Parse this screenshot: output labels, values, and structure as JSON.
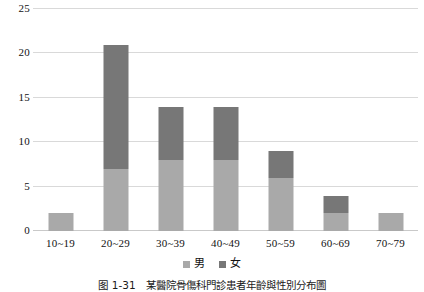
{
  "chart_data": {
    "type": "bar",
    "stacked": true,
    "title": "",
    "subtitle": "",
    "xlabel": "",
    "ylabel": "",
    "categories": [
      "10~19",
      "20~29",
      "30~39",
      "40~49",
      "50~59",
      "60~69",
      "70~79"
    ],
    "series": [
      {
        "name": "男",
        "values": [
          2,
          7,
          8,
          8,
          6,
          2,
          2
        ],
        "color": "#a9a9a9"
      },
      {
        "name": "女",
        "values": [
          0,
          14,
          6,
          6,
          3,
          2,
          0
        ],
        "color": "#777777"
      }
    ],
    "totals": [
      2,
      21,
      14,
      14,
      9,
      4,
      2
    ],
    "ylim": [
      0,
      25
    ],
    "yticks": [
      0,
      5,
      10,
      15,
      20,
      25
    ],
    "ytick_labels": [
      "0",
      "5",
      "10",
      "15",
      "20",
      "25"
    ],
    "grid": true,
    "grid_axis": "y",
    "legend": {
      "position": "bottom",
      "entries": [
        "男",
        "女"
      ]
    }
  },
  "legend": {
    "items": [
      {
        "label": "男",
        "swatch_color": "#a9a9a9"
      },
      {
        "label": "女",
        "swatch_color": "#777777"
      }
    ]
  },
  "caption": {
    "text": "图 1-31　某醫院骨傷科門診患者年齡與性別分布圖"
  }
}
